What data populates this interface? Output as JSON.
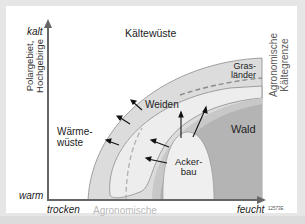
{
  "diagram": {
    "y_axis": {
      "top_label": "kalt",
      "bottom_label": "warm",
      "side_label_line1": "Polargebiet,",
      "side_label_line2": "Hochgebirge"
    },
    "x_axis": {
      "left_label": "trocken",
      "right_label": "feucht"
    },
    "regions": {
      "cold_desert": "Kältewüste",
      "warm_desert_line1": "Wärme-",
      "warm_desert_line2": "wüste",
      "pasture": "Weiden",
      "grassland_line1": "Gras-",
      "grassland_line2": "länder",
      "forest": "Wald",
      "farmland_line1": "Acker-",
      "farmland_line2": "bau"
    },
    "limits": {
      "cold_limit_line1": "Agronomische",
      "cold_limit_line2": "Kältegrenze",
      "dry_limit_line1": "Agronomische",
      "dry_limit_line2": "Trockengrenze"
    },
    "figure_code": "12573E",
    "colors": {
      "background": "#e6e6e6",
      "panel": "#ffffff",
      "outer_band": "#dcdcdc",
      "pasture": "#ececec",
      "forest": "#b4b4b4",
      "transition": "#c8c8c8",
      "farmland": "#eeeeee",
      "axis": "#666666",
      "limit_text": "#b9b9b9"
    }
  }
}
